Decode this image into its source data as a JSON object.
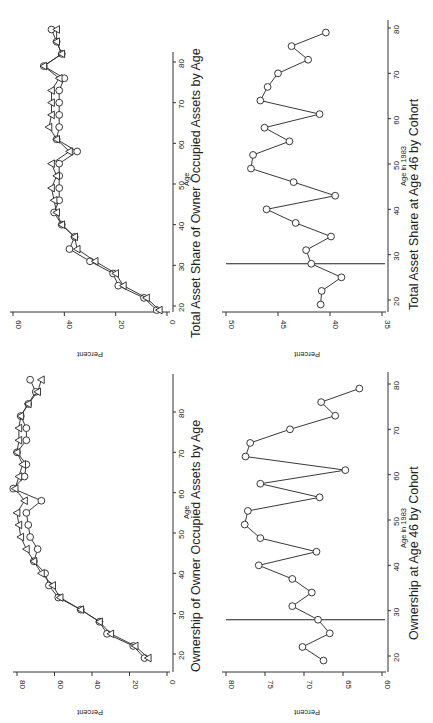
{
  "chart_data": [
    {
      "id": "total-asset-share-by-age",
      "type": "line",
      "title": "Total Asset Share of Owner Occupied Assets by Age",
      "xlabel": "Age",
      "ylabel": "Percent",
      "xticks": [
        20,
        30,
        40,
        50,
        60,
        70,
        80
      ],
      "yticks": [
        0,
        20,
        40,
        60
      ],
      "xlim": [
        18,
        89
      ],
      "ylim": [
        0,
        62
      ],
      "grid": false,
      "legend": null,
      "x": [
        19,
        22,
        25,
        28,
        31,
        34,
        37,
        40,
        43,
        46,
        49,
        52,
        55,
        58,
        61,
        64,
        67,
        70,
        73,
        76,
        79,
        82,
        85,
        88
      ],
      "series": [
        {
          "name": "circle",
          "marker": "circle",
          "values": [
            4,
            9,
            19,
            21,
            30,
            38,
            36,
            41,
            44,
            42,
            42,
            42,
            42,
            35,
            43,
            42,
            42,
            42,
            42,
            40,
            48,
            41,
            43,
            45
          ]
        },
        {
          "name": "triangle",
          "marker": "triangle",
          "values": [
            3,
            8,
            17,
            20,
            28,
            35,
            36,
            41,
            43,
            44,
            45,
            43,
            45,
            38,
            43,
            46,
            45,
            45,
            45,
            42,
            48,
            41,
            43,
            43
          ]
        }
      ]
    },
    {
      "id": "total-asset-share-at-46-by-cohort",
      "type": "line",
      "title": "Total Asset Share at Age 46 by Cohort",
      "xlabel": "Age in 1983",
      "ylabel": "Percent",
      "xticks": [
        20,
        30,
        40,
        50,
        60,
        70,
        80
      ],
      "yticks": [
        35,
        40,
        45,
        50
      ],
      "xlim": [
        18,
        82
      ],
      "ylim": [
        35,
        50.5
      ],
      "grid": false,
      "reference_line_x": 28,
      "x": [
        19,
        22,
        25,
        28,
        31,
        34,
        37,
        40,
        43,
        46,
        49,
        52,
        55,
        58,
        61,
        64,
        67,
        70,
        73,
        76,
        79
      ],
      "series": [
        {
          "name": "circle",
          "marker": "circle",
          "values": [
            40.9,
            40.8,
            38.9,
            41.8,
            42.3,
            39.9,
            43.3,
            46.1,
            39.5,
            43.5,
            47.6,
            47.4,
            43.9,
            46.3,
            41.0,
            46.7,
            46.0,
            45.0,
            42.1,
            43.7,
            40.4
          ]
        }
      ]
    },
    {
      "id": "ownership-by-age",
      "type": "line",
      "title": "Ownership of Owner Occupied Assets by Age",
      "xlabel": "Age",
      "ylabel": "Percent",
      "xticks": [
        20,
        30,
        40,
        50,
        60,
        70,
        80
      ],
      "yticks": [
        0,
        20,
        40,
        60,
        80
      ],
      "xlim": [
        18,
        89
      ],
      "ylim": [
        0,
        84
      ],
      "grid": false,
      "legend": null,
      "x": [
        19,
        22,
        25,
        28,
        31,
        34,
        37,
        40,
        43,
        46,
        49,
        52,
        55,
        58,
        61,
        64,
        67,
        70,
        73,
        76,
        79,
        82,
        85,
        88
      ],
      "series": [
        {
          "name": "circle",
          "marker": "circle",
          "values": [
            12,
            18,
            32,
            36,
            46,
            58,
            63,
            65,
            71,
            69,
            73,
            74,
            75,
            67,
            82,
            76,
            75,
            80,
            75,
            75,
            78,
            74,
            70,
            73
          ]
        },
        {
          "name": "triangle",
          "marker": "triangle",
          "values": [
            10,
            17,
            30,
            36,
            46,
            57,
            61,
            67,
            71,
            75,
            78,
            79,
            80,
            76,
            81,
            79,
            77,
            80,
            79,
            79,
            78,
            74,
            69,
            67
          ]
        }
      ]
    },
    {
      "id": "ownership-at-46-by-cohort",
      "type": "line",
      "title": "Ownership at Age 46 by Cohort",
      "xlabel": "Age in 1983",
      "ylabel": "Percent",
      "xticks": [
        20,
        30,
        40,
        50,
        60,
        70,
        80
      ],
      "yticks": [
        60,
        65,
        70,
        75,
        80
      ],
      "xlim": [
        18,
        82
      ],
      "ylim": [
        60,
        80.5
      ],
      "grid": false,
      "reference_line_x": 28,
      "x": [
        19,
        22,
        25,
        28,
        31,
        34,
        37,
        40,
        43,
        46,
        49,
        52,
        55,
        58,
        61,
        64,
        67,
        70,
        73,
        76,
        79
      ],
      "series": [
        {
          "name": "circle",
          "marker": "circle",
          "values": [
            67.5,
            70.2,
            66.7,
            68.2,
            71.5,
            69.0,
            71.5,
            75.8,
            68.4,
            75.6,
            77.6,
            77.2,
            68.0,
            75.6,
            64.7,
            77.5,
            76.9,
            71.8,
            66.0,
            67.8,
            62.9
          ]
        }
      ]
    }
  ],
  "panels": {
    "top_left": {
      "title": "Total Asset Share of Owner Occupied Assets by Age",
      "xlabel": "Age",
      "ylabel": "Percent"
    },
    "top_right": {
      "title": "Total Asset Share at Age 46 by Cohort",
      "xlabel": "Age in 1983",
      "ylabel": "Percent"
    },
    "bottom_left": {
      "title": "Ownership of Owner Occupied Assets by Age",
      "xlabel": "Age",
      "ylabel": "Percent"
    },
    "bottom_right": {
      "title": "Ownership at Age 46 by Cohort",
      "xlabel": "Age in 1983",
      "ylabel": "Percent"
    }
  }
}
